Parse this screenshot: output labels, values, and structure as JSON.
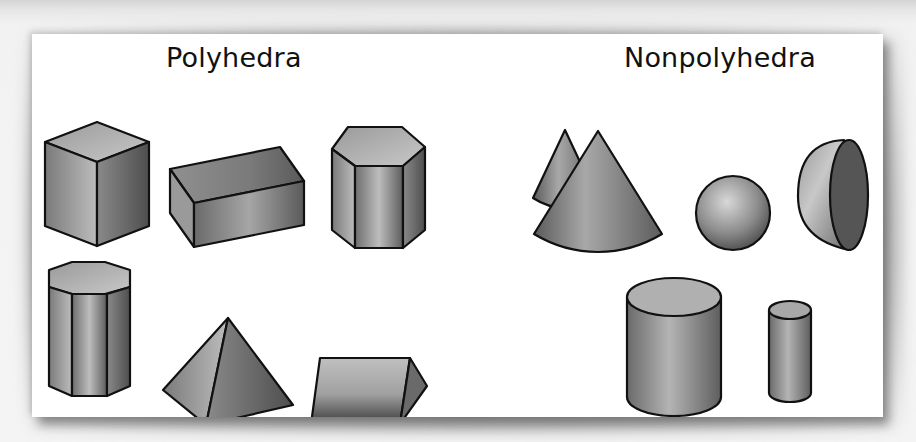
{
  "figure": {
    "groups": [
      {
        "title": "Polyhedra",
        "shapes": [
          {
            "name": "cube"
          },
          {
            "name": "rectangular prism"
          },
          {
            "name": "hexagonal prism"
          },
          {
            "name": "octagonal prism"
          },
          {
            "name": "square pyramid"
          },
          {
            "name": "triangular prism"
          }
        ]
      },
      {
        "title": "Nonpolyhedra",
        "shapes": [
          {
            "name": "cone"
          },
          {
            "name": "sphere"
          },
          {
            "name": "hemisphere"
          },
          {
            "name": "cylinder"
          },
          {
            "name": "narrow cylinder"
          }
        ]
      }
    ],
    "colors": {
      "card": "#ffffff",
      "background": "#f2f2f2",
      "shape_light": "#bfbfbf",
      "shape_mid": "#8a8a8a",
      "shape_dark": "#555555",
      "outline": "#111111"
    }
  }
}
